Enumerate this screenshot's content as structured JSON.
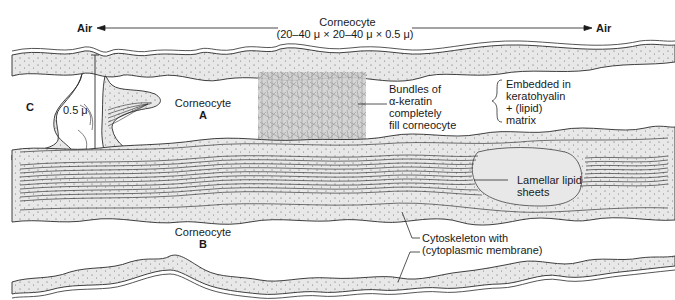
{
  "title": {
    "line1": "Corneocyte",
    "line2": "(20–40 μ × 20–40 μ × 0.5 μ)"
  },
  "air_left": "Air",
  "air_right": "Air",
  "labels": {
    "c": "C",
    "thickness": "0.5 μ",
    "corneocyte_a_line1": "Corneocyte",
    "corneocyte_a_line2": "A",
    "corneocyte_b_line1": "Corneocyte",
    "corneocyte_b_line2": "B",
    "keratin": [
      "Bundles of",
      "α-keratin",
      "completely",
      "fill corneocyte"
    ],
    "matrix": [
      "Embedded in",
      "keratohyalin",
      "+ (lipid)",
      "matrix"
    ],
    "lamellar": [
      "Lamellar lipid",
      "sheets"
    ],
    "cytoskeleton": [
      "Cytoskeleton with",
      "(cytoplasmic membrane)"
    ]
  },
  "colors": {
    "stroke": "#2a2a2a",
    "cytoplasm_fill": "#e6e6e6",
    "keratin_fill": "#bdbdbd",
    "background": "#ffffff"
  }
}
